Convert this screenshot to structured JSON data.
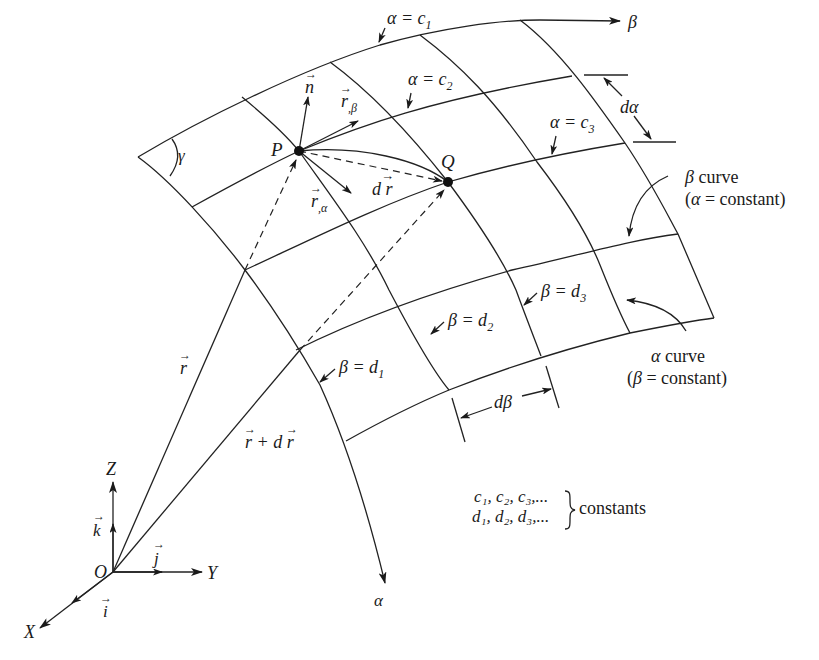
{
  "figure": {
    "axes": {
      "origin": "O",
      "x_axis": "X",
      "y_axis": "Y",
      "z_axis": "Z",
      "unit_i": "i",
      "unit_j": "j",
      "unit_k": "k"
    },
    "curve_directions": {
      "alpha_dir": "α",
      "beta_dir": "β"
    },
    "alpha_lines": [
      {
        "label": "α = c",
        "sub": "1"
      },
      {
        "label": "α = c",
        "sub": "2"
      },
      {
        "label": "α = c",
        "sub": "3"
      }
    ],
    "beta_lines": [
      {
        "label": "β = d",
        "sub": "1"
      },
      {
        "label": "β = d",
        "sub": "2"
      },
      {
        "label": "β = d",
        "sub": "3"
      }
    ],
    "points": {
      "p": "P",
      "q": "Q"
    },
    "vectors": {
      "normal": "n",
      "r_beta": "r",
      "r_beta_sub": ",β",
      "r_alpha": "r",
      "r_alpha_sub": ",α",
      "dr": "d r",
      "r": "r",
      "r_plus_dr": "r + d r"
    },
    "angle": "γ",
    "increments": {
      "d_alpha": "dα",
      "d_beta": "dβ"
    },
    "annotations": {
      "beta_curve_line1": "β curve",
      "beta_curve_line2": "(α = constant)",
      "alpha_curve_line1": "α curve",
      "alpha_curve_line2": "(β = constant)"
    },
    "constants_note": {
      "row1": "c₁, c₂, c₃,...",
      "row2": "d₁, d₂, d₃,...",
      "label": "constants"
    }
  }
}
